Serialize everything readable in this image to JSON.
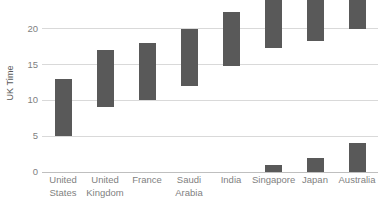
{
  "chart_data": {
    "type": "bar",
    "subtype": "floating-range-bar",
    "title": "",
    "xlabel": "",
    "ylabel": "UK Time",
    "ylim": [
      0,
      24
    ],
    "yticks": [
      0,
      5,
      10,
      15,
      20
    ],
    "ytick_labels": [
      "0",
      "5",
      "10",
      "15",
      "20"
    ],
    "grid": true,
    "legend": false,
    "bar_color": "#595959",
    "grid_color": "#d9d9d9",
    "axis_color": "#bfbfbf",
    "tick_label_color": "#7f7f7f",
    "categories": [
      "United\nStates",
      "United\nKingdom",
      "France",
      "Saudi\nArabia",
      "India",
      "Singapore",
      "Japan",
      "Australia"
    ],
    "series": [
      {
        "name": "Working hours (UK time)",
        "ranges": [
          {
            "category": "United States",
            "start": 5.0,
            "end": 13.0
          },
          {
            "category": "United Kingdom",
            "start": 9.0,
            "end": 17.0
          },
          {
            "category": "France",
            "start": 10.0,
            "end": 18.0
          },
          {
            "category": "Saudi Arabia",
            "start": 12.0,
            "end": 20.0
          },
          {
            "category": "India",
            "start": 14.8,
            "end": 22.3
          },
          {
            "category": "Singapore",
            "start": 17.3,
            "end": 24.0
          },
          {
            "category": "Japan",
            "start": 18.3,
            "end": 24.0
          },
          {
            "category": "Australia",
            "start": 20.0,
            "end": 24.0
          }
        ]
      },
      {
        "name": "Wrapped hours past midnight (UK time)",
        "ranges": [
          {
            "category": "Singapore",
            "start": 0.0,
            "end": 1.0
          },
          {
            "category": "Japan",
            "start": 0.0,
            "end": 2.0
          },
          {
            "category": "Australia",
            "start": 0.0,
            "end": 4.0
          }
        ]
      }
    ]
  }
}
